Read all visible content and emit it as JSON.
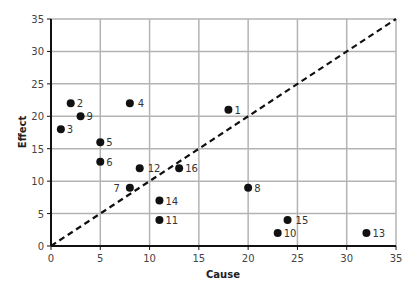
{
  "chart_data": {
    "type": "scatter",
    "title": "",
    "xlabel": "Cause",
    "ylabel": "Effect",
    "xlim": [
      0,
      35
    ],
    "ylim": [
      0,
      35
    ],
    "xticks": [
      0,
      5,
      10,
      15,
      20,
      25,
      30,
      35
    ],
    "yticks": [
      0,
      5,
      10,
      15,
      20,
      25,
      30,
      35
    ],
    "grid": true,
    "legend": null,
    "reference_line": {
      "style": "dashed",
      "from": [
        0,
        0
      ],
      "to": [
        35,
        35
      ],
      "label": "y = x"
    },
    "points": [
      {
        "label": "1",
        "x": 18,
        "y": 21
      },
      {
        "label": "2",
        "x": 2,
        "y": 22
      },
      {
        "label": "3",
        "x": 1,
        "y": 18
      },
      {
        "label": "4",
        "x": 8,
        "y": 22
      },
      {
        "label": "5",
        "x": 5,
        "y": 16
      },
      {
        "label": "6",
        "x": 5,
        "y": 13
      },
      {
        "label": "7",
        "x": 8,
        "y": 9
      },
      {
        "label": "8",
        "x": 20,
        "y": 9
      },
      {
        "label": "9",
        "x": 3,
        "y": 20
      },
      {
        "label": "10",
        "x": 23,
        "y": 2
      },
      {
        "label": "11",
        "x": 11,
        "y": 4
      },
      {
        "label": "12",
        "x": 9,
        "y": 12
      },
      {
        "label": "13",
        "x": 32,
        "y": 2
      },
      {
        "label": "14",
        "x": 11,
        "y": 7
      },
      {
        "label": "15",
        "x": 24,
        "y": 4
      },
      {
        "label": "16",
        "x": 13,
        "y": 12
      }
    ]
  },
  "colors": {
    "grid": "#b3b3b3",
    "axis": "#111111",
    "point": "#111111",
    "line": "#111111"
  },
  "label_offsets": {
    "7": {
      "dx": -10,
      "anchor": "end"
    },
    "4": {
      "dx": 8,
      "anchor": "start"
    },
    "12": {
      "dx": 8,
      "anchor": "start"
    },
    "15": {
      "dx": 8,
      "anchor": "start"
    }
  }
}
